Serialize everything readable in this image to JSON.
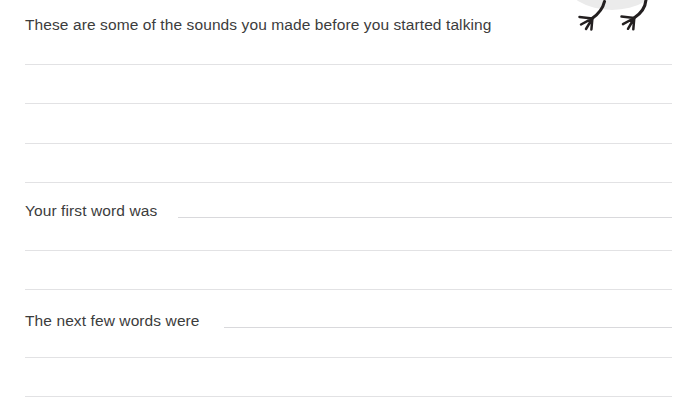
{
  "page": {
    "background_color": "#ffffff",
    "text_color": "#3c3c3c",
    "rule_color": "#e2e2e4",
    "inline_rule_color": "#d9d9dc",
    "width": 689,
    "height": 411
  },
  "header": {
    "prompt": "These are some of the sounds you made before you started talking"
  },
  "prompts": [
    {
      "label": "Your first word was"
    },
    {
      "label": "The next few words were"
    }
  ],
  "illustration": {
    "name": "bird-legs-illustration",
    "description": "cropped bird with two legs and three-toed feet",
    "body_color": "#ebebeb",
    "leg_color": "#231f20"
  },
  "writing_lines": [
    {
      "id": "line-1",
      "y": 64
    },
    {
      "id": "line-2",
      "y": 103
    },
    {
      "id": "line-3",
      "y": 143
    },
    {
      "id": "line-4",
      "y": 182
    },
    {
      "id": "line-5",
      "y": 250
    },
    {
      "id": "line-6",
      "y": 289
    },
    {
      "id": "line-7",
      "y": 357
    },
    {
      "id": "line-8",
      "y": 396
    }
  ]
}
